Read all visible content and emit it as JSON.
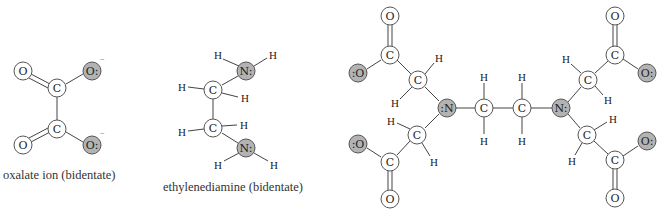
{
  "colors": {
    "donor_atom_fill": "#b3b3b3",
    "atom_fill": "#ffffff",
    "bond": "#444444",
    "text": "#333333"
  },
  "molecules": [
    {
      "id": "oxalate",
      "caption": "oxalate ion (bidentate)",
      "atoms": [
        {
          "id": "o1",
          "label": "O",
          "x": 23,
          "y": 71,
          "donor": false
        },
        {
          "id": "o2",
          "label": "O:",
          "x": 92,
          "y": 71,
          "donor": true,
          "charge": "−"
        },
        {
          "id": "c1",
          "label": "C",
          "x": 57,
          "y": 88,
          "donor": false
        },
        {
          "id": "c2",
          "label": "C",
          "x": 57,
          "y": 129,
          "donor": false
        },
        {
          "id": "o3",
          "label": "O",
          "x": 23,
          "y": 145,
          "donor": false
        },
        {
          "id": "o4",
          "label": "O:",
          "x": 92,
          "y": 145,
          "donor": true,
          "charge": "−"
        }
      ]
    },
    {
      "id": "ethylenediamine",
      "caption": "ethylenediamine (bidentate)",
      "atoms": [
        {
          "id": "n1",
          "label": "N:",
          "x": 246,
          "y": 71,
          "donor": true
        },
        {
          "id": "c1",
          "label": "C",
          "x": 213,
          "y": 90,
          "donor": false
        },
        {
          "id": "c2",
          "label": "C",
          "x": 213,
          "y": 128,
          "donor": false
        },
        {
          "id": "n2",
          "label": "N:",
          "x": 246,
          "y": 148,
          "donor": true
        }
      ],
      "hydrogens": [
        "H",
        "H",
        "H",
        "H",
        "H",
        "H",
        "H",
        "H"
      ]
    },
    {
      "id": "edta",
      "caption": "",
      "atoms": [
        {
          "label": "O",
          "donor": false
        },
        {
          "label": "C",
          "donor": false
        },
        {
          "label": ":O",
          "donor": true
        },
        {
          "label": "C",
          "donor": false
        },
        {
          "label": ":N",
          "donor": true
        },
        {
          "label": "C",
          "donor": false
        },
        {
          "label": "C",
          "donor": false
        },
        {
          "label": "N:",
          "donor": true
        },
        {
          "label": "C",
          "donor": false
        },
        {
          "label": "C",
          "donor": false
        },
        {
          "label": "O:",
          "donor": true
        },
        {
          "label": "O",
          "donor": false
        }
      ]
    }
  ],
  "labels": {
    "O": "O",
    "O_donor_right": "O:",
    "O_donor_left": ":O",
    "C": "C",
    "N_donor_right": "N:",
    "N_donor_left": ":N",
    "H": "H",
    "minus": "−"
  },
  "captions": {
    "oxalate": "oxalate ion (bidentate)",
    "ethylenediamine": "ethylenediamine (bidentate)"
  }
}
